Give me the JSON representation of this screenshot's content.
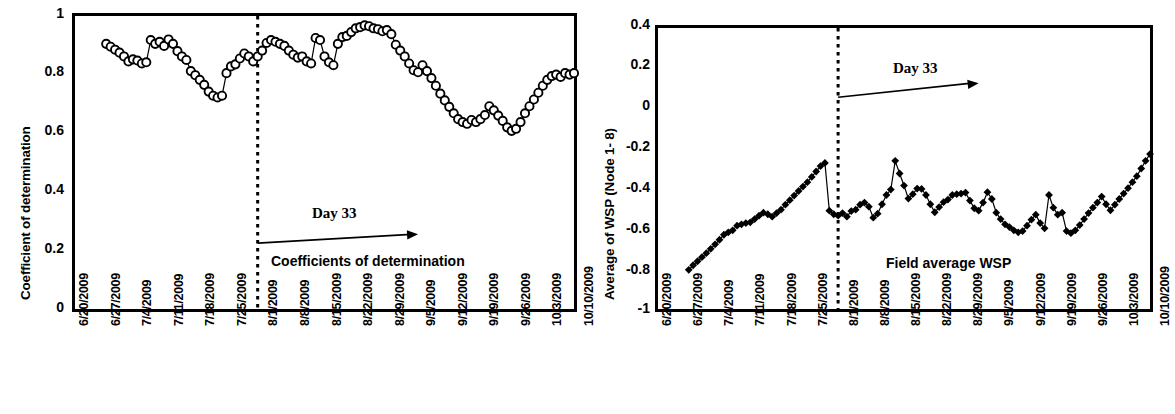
{
  "figure": {
    "panel_count": 2,
    "background": "#ffffff",
    "foreground": "#000000"
  },
  "chart_data": [
    {
      "id": "coefficient-of-determination",
      "type": "line",
      "title": "",
      "annotation_caption": "Coefficients of determination",
      "annotation_marker": "Day 33",
      "xlabel": "",
      "ylabel": "Coefficient of determination",
      "ylim": [
        0,
        1
      ],
      "yticks": [
        "0",
        "0.2",
        "0.4",
        "0.6",
        "0.8",
        "1"
      ],
      "ytick_values": [
        0,
        0.2,
        0.4,
        0.6,
        0.8,
        1
      ],
      "xlim": [
        "6/20/2009",
        "10/10/2009"
      ],
      "xticks": [
        "6/20/2009",
        "6/27/2009",
        "7/4/2009",
        "7/11/2009",
        "7/18/2009",
        "7/25/2009",
        "8/1/2009",
        "8/8/2009",
        "8/15/2009",
        "8/22/2009",
        "8/29/2009",
        "9/5/2009",
        "9/12/2009",
        "9/19/2009",
        "9/26/2009",
        "10/3/2009",
        "10/10/2009"
      ],
      "grid": false,
      "legend": false,
      "marker": "open-circle",
      "line_color": "#000000",
      "vline_at_day": 41,
      "vline_style": "dotted",
      "series": [
        {
          "name": "Coefficient of determination",
          "x_day_offset_from_6_20_2009": [
            7,
            8,
            9,
            10,
            11,
            12,
            13,
            14,
            15,
            16,
            17,
            18,
            19,
            20,
            21,
            22,
            23,
            24,
            25,
            26,
            27,
            28,
            29,
            30,
            31,
            32,
            33,
            34,
            35,
            36,
            37,
            38,
            39,
            40,
            41,
            42,
            43,
            44,
            45,
            46,
            47,
            48,
            49,
            50,
            51,
            52,
            53,
            54,
            55,
            56,
            57,
            58,
            59,
            60,
            61,
            62,
            63,
            64,
            65,
            66,
            67,
            68,
            69,
            70,
            71,
            72,
            73,
            74,
            75,
            76,
            77,
            78,
            79,
            80,
            81,
            82,
            83,
            84,
            85,
            86,
            87,
            88,
            89,
            90,
            91,
            92,
            93,
            94,
            95,
            96,
            97,
            98,
            99,
            100,
            101,
            102,
            103,
            104,
            105,
            106,
            107,
            108,
            109,
            110,
            111,
            112
          ],
          "values": [
            0.905,
            0.895,
            0.885,
            0.875,
            0.862,
            0.845,
            0.852,
            0.848,
            0.838,
            0.842,
            0.918,
            0.905,
            0.912,
            0.898,
            0.92,
            0.905,
            0.88,
            0.862,
            0.85,
            0.812,
            0.798,
            0.782,
            0.765,
            0.742,
            0.728,
            0.722,
            0.728,
            0.805,
            0.828,
            0.835,
            0.855,
            0.872,
            0.862,
            0.845,
            0.862,
            0.882,
            0.908,
            0.918,
            0.912,
            0.905,
            0.898,
            0.882,
            0.868,
            0.858,
            0.862,
            0.845,
            0.838,
            0.925,
            0.918,
            0.862,
            0.842,
            0.832,
            0.905,
            0.928,
            0.932,
            0.945,
            0.958,
            0.962,
            0.968,
            0.965,
            0.958,
            0.955,
            0.948,
            0.952,
            0.938,
            0.902,
            0.882,
            0.862,
            0.838,
            0.815,
            0.808,
            0.832,
            0.812,
            0.788,
            0.762,
            0.735,
            0.712,
            0.69,
            0.668,
            0.648,
            0.638,
            0.632,
            0.645,
            0.638,
            0.648,
            0.662,
            0.692,
            0.678,
            0.66,
            0.642,
            0.62,
            0.608,
            0.615,
            0.638,
            0.668,
            0.692,
            0.715,
            0.738,
            0.762,
            0.782,
            0.795,
            0.8,
            0.792,
            0.805,
            0.8,
            0.805
          ]
        }
      ]
    },
    {
      "id": "field-average-wsp",
      "type": "line",
      "title": "",
      "annotation_caption": "Field average WSP",
      "annotation_marker": "Day 33",
      "xlabel": "",
      "ylabel": "Average of WSP (Node 1- 8)",
      "ylim": [
        -1,
        0.4
      ],
      "yticks": [
        "0.4",
        "0.2",
        "0",
        "-0.2",
        "-0.4",
        "-0.6",
        "-0.8",
        "-1"
      ],
      "ytick_values": [
        0.4,
        0.2,
        0,
        -0.2,
        -0.4,
        -0.6,
        -0.8,
        -1
      ],
      "xlim": [
        "6/20/2009",
        "10/10/2009"
      ],
      "xticks": [
        "6/20/2009",
        "6/27/2009",
        "7/4/2009",
        "7/11/2009",
        "7/18/2009",
        "7/25/2009",
        "8/1/2009",
        "8/8/2009",
        "8/15/2009",
        "8/22/2009",
        "8/29/2009",
        "9/5/2009",
        "9/12/2009",
        "9/19/2009",
        "9/26/2009",
        "10/3/2009",
        "10/10/2009"
      ],
      "grid": false,
      "legend": false,
      "marker": "filled-diamond",
      "line_color": "#000000",
      "vline_at_day": 41,
      "vline_style": "dotted",
      "series": [
        {
          "name": "Average of WSP (Node 1-8)",
          "x_day_offset_from_6_20_2009": [
            7,
            8,
            9,
            10,
            11,
            12,
            13,
            14,
            15,
            16,
            17,
            18,
            19,
            20,
            21,
            22,
            23,
            24,
            25,
            26,
            27,
            28,
            29,
            30,
            31,
            32,
            33,
            34,
            35,
            36,
            37,
            38,
            39,
            40,
            41,
            42,
            43,
            44,
            45,
            46,
            47,
            48,
            49,
            50,
            51,
            52,
            53,
            54,
            55,
            56,
            57,
            58,
            59,
            60,
            61,
            62,
            63,
            64,
            65,
            66,
            67,
            68,
            69,
            70,
            71,
            72,
            73,
            74,
            75,
            76,
            77,
            78,
            79,
            80,
            81,
            82,
            83,
            84,
            85,
            86,
            87,
            88,
            89,
            90,
            91,
            92,
            93,
            94,
            95,
            96,
            97,
            98,
            99,
            100,
            101,
            102,
            103,
            104,
            105,
            106,
            107,
            108,
            109,
            110,
            111,
            112
          ],
          "values": [
            -0.805,
            -0.782,
            -0.762,
            -0.742,
            -0.722,
            -0.7,
            -0.678,
            -0.655,
            -0.63,
            -0.618,
            -0.608,
            -0.585,
            -0.578,
            -0.572,
            -0.568,
            -0.552,
            -0.535,
            -0.52,
            -0.528,
            -0.54,
            -0.522,
            -0.505,
            -0.48,
            -0.458,
            -0.435,
            -0.412,
            -0.39,
            -0.368,
            -0.342,
            -0.315,
            -0.288,
            -0.272,
            -0.51,
            -0.528,
            -0.535,
            -0.522,
            -0.54,
            -0.512,
            -0.505,
            -0.48,
            -0.47,
            -0.49,
            -0.545,
            -0.525,
            -0.478,
            -0.432,
            -0.405,
            -0.262,
            -0.325,
            -0.385,
            -0.45,
            -0.428,
            -0.4,
            -0.402,
            -0.432,
            -0.478,
            -0.518,
            -0.492,
            -0.468,
            -0.455,
            -0.432,
            -0.428,
            -0.425,
            -0.42,
            -0.46,
            -0.498,
            -0.51,
            -0.47,
            -0.418,
            -0.452,
            -0.52,
            -0.552,
            -0.578,
            -0.592,
            -0.608,
            -0.618,
            -0.612,
            -0.585,
            -0.555,
            -0.53,
            -0.572,
            -0.598,
            -0.432,
            -0.495,
            -0.53,
            -0.52,
            -0.612,
            -0.622,
            -0.608,
            -0.582,
            -0.552,
            -0.522,
            -0.495,
            -0.47,
            -0.44,
            -0.478,
            -0.508,
            -0.48,
            -0.452,
            -0.425,
            -0.398,
            -0.368,
            -0.338,
            -0.3,
            -0.262,
            -0.228
          ]
        }
      ]
    }
  ]
}
